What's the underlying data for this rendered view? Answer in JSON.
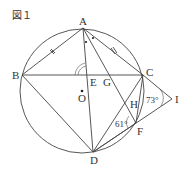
{
  "figure": {
    "title": "図１",
    "points": {
      "A": {
        "label": "A",
        "x": 83,
        "y": 28
      },
      "B": {
        "label": "B",
        "x": 22,
        "y": 75
      },
      "C": {
        "label": "C",
        "x": 143,
        "y": 75
      },
      "D": {
        "label": "D",
        "x": 93,
        "y": 152
      },
      "E": {
        "label": "E",
        "x": 88,
        "y": 75
      },
      "G": {
        "label": "G",
        "x": 103,
        "y": 75
      },
      "O": {
        "label": "O",
        "x": 82,
        "y": 91
      },
      "H": {
        "label": "H",
        "x": 126,
        "y": 104
      },
      "F": {
        "label": "F",
        "x": 136,
        "y": 123
      },
      "I": {
        "label": "I",
        "x": 172,
        "y": 99
      }
    },
    "angles": {
      "angle_CIF": "73°",
      "angle_HFD": "61°"
    },
    "colors": {
      "line": "#444444",
      "text": "#333333",
      "background": "#ffffff"
    }
  }
}
